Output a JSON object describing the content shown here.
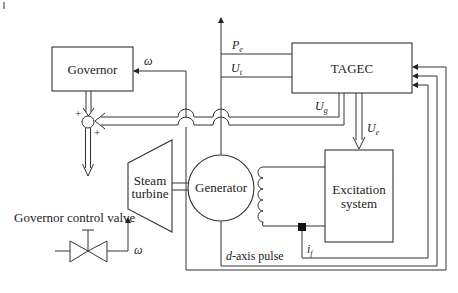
{
  "blocks": {
    "governor": "Governor",
    "tagec": "TAGEC",
    "steam_turbine_line1": "Steam",
    "steam_turbine_line2": "turbine",
    "generator": "Generator",
    "excitation_line1": "Excitation",
    "excitation_line2": "system"
  },
  "labels": {
    "omega_top": "ω",
    "omega_bottom": "ω",
    "pe_main": "P",
    "pe_sub": "e",
    "ut_main": "U",
    "ut_sub": "t",
    "ug_main": "U",
    "ug_sub": "g",
    "ue_main": "U",
    "ue_sub": "e",
    "if_main": "i",
    "if_sub": "f",
    "d_axis_italic": "d",
    "d_axis_rest": "-axis pulse",
    "governor_valve": "Governor control valve",
    "plus_top": "+",
    "plus_bottom": "+"
  },
  "colors": {
    "line": "#333333",
    "background": "#ffffff"
  }
}
